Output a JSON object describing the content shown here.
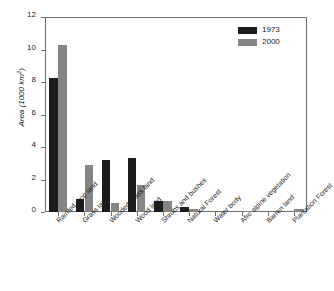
{
  "chart_data": {
    "type": "bar",
    "title": "",
    "xlabel": "",
    "ylabel": "Area (1000 km2)",
    "ylabel_prefix": "Area (1000 km",
    "ylabel_superscript": "2",
    "ylabel_suffix": ")",
    "ylim": [
      0,
      12
    ],
    "yticks": [
      0,
      2,
      4,
      6,
      8,
      10,
      12
    ],
    "ytick_labels": [
      "0",
      "2",
      "4",
      "6",
      "8",
      "10",
      "12"
    ],
    "grid": false,
    "legend_position": "top-right",
    "categories": [
      "Rainfed crop land",
      "Grass land",
      "Wooded grass land",
      "Wood land",
      "Shrubs and bushes",
      "Natural Forest",
      "Water body",
      "Afro alpine vegetation",
      "Barren land",
      "Plantation Forest"
    ],
    "series": [
      {
        "name": "1973",
        "color": "#1c1c1c",
        "values": [
          8.25,
          0.78,
          3.22,
          3.3,
          0.7,
          0.3,
          0.0,
          0.0,
          0.0,
          0.0
        ]
      },
      {
        "name": "2000",
        "color": "#858585",
        "values": [
          10.3,
          2.9,
          0.57,
          1.68,
          0.67,
          0.2,
          0.0,
          0.03,
          0.0,
          0.18
        ]
      }
    ]
  },
  "legend": {
    "items": [
      {
        "label": "1973",
        "color": "#1c1c1c"
      },
      {
        "label": "2000",
        "color": "#858585"
      }
    ]
  },
  "colors": {
    "axis": "#6e6e6e",
    "text": "#1a1a1a",
    "background": "#ffffff",
    "series_1973": "#1c1c1c",
    "series_2000": "#858585"
  }
}
